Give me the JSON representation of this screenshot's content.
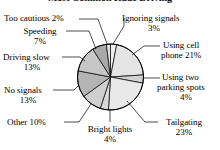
{
  "figure": {
    "title": "Most Common Rude Driving",
    "title_visible_partially": true,
    "background_color": "#ffffff",
    "outline_color": "#000000"
  },
  "labels": {
    "too_cautious": "Too cautious 2%",
    "speeding_name": "Speeding",
    "speeding_value": "7%",
    "driving_slow_name": "Driving slow",
    "driving_slow_value": "13%",
    "no_signals_name": "No signals",
    "no_signals_value": "13%",
    "other": "Other 10%",
    "bright_lights_name": "Bright lights",
    "bright_lights_value": "4%",
    "tailgating_name": "Tailgating",
    "tailgating_value": "23%",
    "parking_line1": "Using two",
    "parking_line2": "parking spots",
    "parking_value": "4%",
    "cell_line1": "Using cell",
    "cell_line2": "phone 21%",
    "ignoring_name": "Ignoring signals",
    "ignoring_value": "3%"
  },
  "chart_data": {
    "type": "pie",
    "title": "Most Common Rude Driving",
    "xlabel": "",
    "ylabel": "",
    "total": 100,
    "units": "percent",
    "legend_position": "none",
    "labels_position": "outside-with-leader-lines",
    "grid": false,
    "start_angle_deg": 90,
    "direction": "clockwise",
    "categories": [
      "Ignoring signals",
      "Using cell phone",
      "Using two parking spots",
      "Tailgating",
      "Bright lights",
      "Other",
      "No signals",
      "Driving slow",
      "Speeding",
      "Too cautious"
    ],
    "values": [
      3,
      21,
      4,
      23,
      4,
      10,
      13,
      13,
      7,
      2
    ],
    "slices": [
      {
        "label": "Ignoring signals",
        "value": 3,
        "color": "#efefef"
      },
      {
        "label": "Using cell phone",
        "value": 21,
        "color": "#e4e4e4"
      },
      {
        "label": "Using two parking spots",
        "value": 4,
        "color": "#d2d2d2"
      },
      {
        "label": "Tailgating",
        "value": 23,
        "color": "#e9e9e9"
      },
      {
        "label": "Bright lights",
        "value": 4,
        "color": "#d8d8d8"
      },
      {
        "label": "Other",
        "value": 10,
        "color": "#cfcfcf"
      },
      {
        "label": "No signals",
        "value": 13,
        "color": "#b4b4b4"
      },
      {
        "label": "Driving slow",
        "value": 13,
        "color": "#c6c6c6"
      },
      {
        "label": "Speeding",
        "value": 7,
        "color": "#a8a8a8"
      },
      {
        "label": "Too cautious",
        "value": 2,
        "color": "#e0e0e0"
      }
    ]
  }
}
